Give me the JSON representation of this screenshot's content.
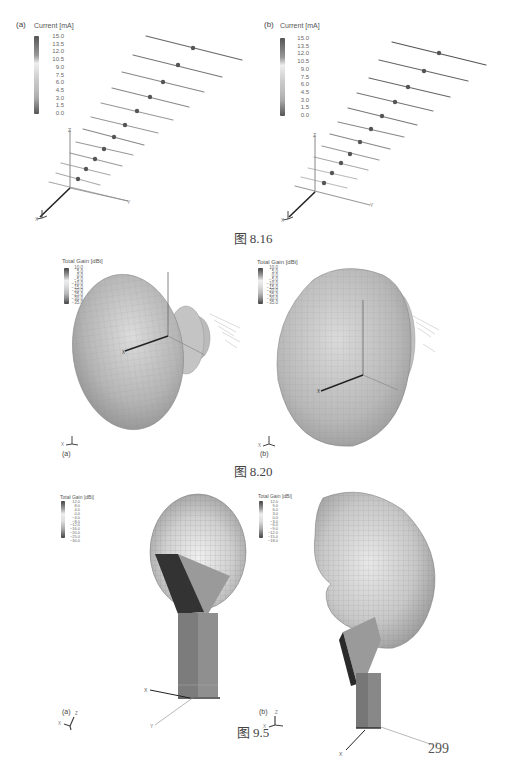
{
  "figures": [
    {
      "caption": "图 8.16",
      "panels": [
        {
          "label": "(a)",
          "legend_title": "Current [mA]",
          "legend_values": [
            "15.0",
            "13.5",
            "12.0",
            "10.5",
            "9.0",
            "7.5",
            "6.0",
            "4.5",
            "3.0",
            "1.5",
            "0.0"
          ],
          "axes": {
            "z": "Z",
            "x": "X",
            "y": "Y"
          }
        },
        {
          "label": "(b)",
          "legend_title": "Current [mA]",
          "legend_values": [
            "15.0",
            "13.5",
            "12.0",
            "10.5",
            "9.0",
            "7.5",
            "6.0",
            "4.5",
            "3.0",
            "1.5",
            "0.0"
          ],
          "axes": {
            "z": "Z",
            "x": "X",
            "y": "Y"
          }
        }
      ]
    },
    {
      "caption": "图 8.20",
      "panels": [
        {
          "label": "(a)",
          "legend_title": "Total Gain [dBi]",
          "legend_values": [
            "10.0",
            "5.0",
            "0.0",
            "−5.0",
            "−10.0",
            "−15.0",
            "−20.0",
            "−25.0",
            "−30.0",
            "−35.0"
          ],
          "axes": {
            "x": "X",
            "y": "Y",
            "z": "Z"
          }
        },
        {
          "label": "(b)",
          "legend_title": "Total Gain [dBi]",
          "legend_values": [
            "10.0",
            "5.0",
            "0.0",
            "−5.0",
            "−10.0",
            "−15.0",
            "−20.0",
            "−25.0",
            "−30.0",
            "−35.0"
          ],
          "axes": {
            "x": "X",
            "y": "Y",
            "z": "Z"
          }
        }
      ]
    },
    {
      "caption": "图 9.5",
      "panels": [
        {
          "label": "(a)",
          "legend_title": "Total Gain [dBi]",
          "legend_values": [
            "12.0",
            "8.0",
            "4.0",
            "0.0",
            "−4.0",
            "−8.0",
            "−12.0",
            "−16.0",
            "−20.0",
            "−25.0",
            "−30.0"
          ],
          "axes": {
            "x": "X",
            "y": "Y",
            "z": "Z"
          }
        },
        {
          "label": "(b)",
          "legend_title": "Total Gain [dBi]",
          "legend_values": [
            "12.0",
            "9.0",
            "6.0",
            "3.0",
            "0.0",
            "−3.0",
            "−6.0",
            "−9.0",
            "−12.0",
            "−15.0",
            "−18.0"
          ],
          "axes": {
            "x": "X",
            "y": "Y",
            "z": "Z"
          }
        }
      ]
    }
  ],
  "page_number": "299"
}
